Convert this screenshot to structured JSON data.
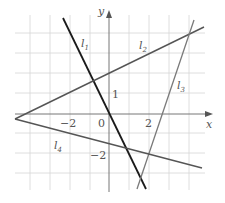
{
  "diagram": {
    "type": "coordinate-plane-lines",
    "axes": {
      "x_label": "x",
      "y_label": "y",
      "origin_label": "0",
      "tick_labels": {
        "x_neg2": "−2",
        "x_2": "2",
        "y_1": "1",
        "y_neg2": "−2"
      }
    },
    "lines": [
      {
        "id": "l1",
        "label": "l",
        "sub": "1",
        "color": "#1a1a1a"
      },
      {
        "id": "l2",
        "label": "l",
        "sub": "2",
        "color": "#555555"
      },
      {
        "id": "l3",
        "label": "l",
        "sub": "3",
        "color": "#777777"
      },
      {
        "id": "l4",
        "label": "l",
        "sub": "4",
        "color": "#555555"
      }
    ],
    "colors": {
      "grid": "#d6d6d6",
      "axis": "#777777"
    }
  }
}
